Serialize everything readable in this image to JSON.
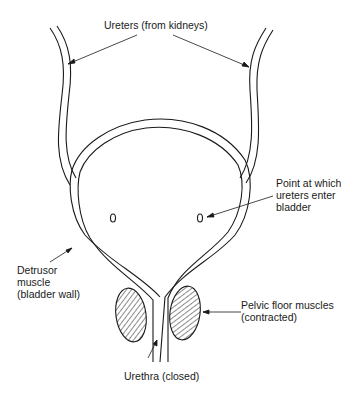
{
  "diagram": {
    "colors": {
      "line": "#1a1a1a",
      "background": "#ffffff"
    },
    "labels": {
      "ureters": "Ureters (from kidneys)",
      "entry_point": "Point at which\nureters enter\nbladder",
      "detrusor": "Detrusor\nmuscle\n(bladder wall)",
      "pelvic_floor": "Pelvic floor muscles\n(contracted)",
      "urethra": "Urethra (closed)"
    }
  }
}
